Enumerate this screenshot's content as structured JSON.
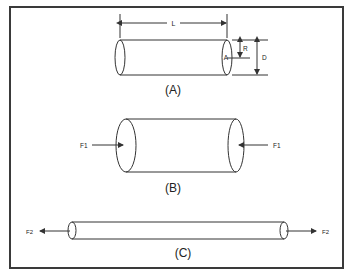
{
  "figure": {
    "type": "cylinder-deformation-diagram",
    "panels": [
      {
        "id": "A",
        "caption": "(A)",
        "description": "Undeformed cylinder with dimensions",
        "labels": {
          "length": "L",
          "radius": "R",
          "diameter": "D",
          "area": "A"
        }
      },
      {
        "id": "B",
        "caption": "(B)",
        "description": "Cylinder under compression",
        "force_label": "F1",
        "force_direction": "inward"
      },
      {
        "id": "C",
        "caption": "(C)",
        "description": "Cylinder under tension",
        "force_label": "F2",
        "force_direction": "outward"
      }
    ]
  },
  "colors": {
    "line": "#333333",
    "border": "#3a3a3a",
    "background": "#ffffff"
  }
}
